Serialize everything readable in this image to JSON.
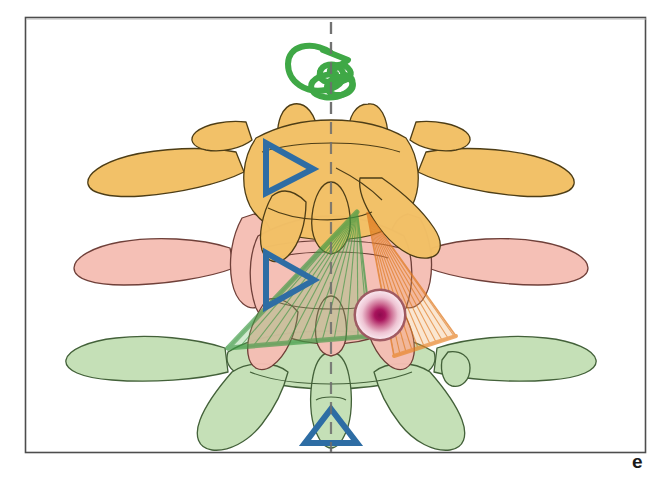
{
  "figure": {
    "panel_letter": "e",
    "caption_visible": "",
    "frame": {
      "x": 25,
      "y": 17,
      "width": 620,
      "height": 435,
      "border_color": "#4d4d4d"
    },
    "background_color": "#ffffff"
  },
  "colors": {
    "vertebra_superior_fill": "#F2C066",
    "vertebra_superior_stroke": "#4a3a12",
    "vertebra_middle_fill": "#F5BEB4",
    "vertebra_middle_stroke": "#6b3a33",
    "vertebra_inferior_fill": "#C4DFB5",
    "vertebra_inferior_stroke": "#3d5c33",
    "rotation_arrow": "#3FA846",
    "marker_triangle": "#2E6DA4",
    "force_cone_green": "#4CA64C",
    "force_cone_orange": "#E8862A",
    "target_center": "#A8135C",
    "target_edge": "#F7DDE6",
    "target_ring": "#9C5560",
    "midline_axis": "#808080"
  },
  "anatomy": {
    "vertebrae": [
      {
        "name": "superior-vertebra",
        "level_color": "orange",
        "position": "top"
      },
      {
        "name": "middle-vertebra",
        "level_color": "pink",
        "position": "middle"
      },
      {
        "name": "inferior-vertebra",
        "level_color": "green",
        "position": "bottom"
      }
    ],
    "midline_axis": {
      "name": "vertical-dashed-axis",
      "style": "dashed",
      "x": 331,
      "y_top": 22,
      "y_bottom": 452
    }
  },
  "overlays": {
    "rotation_arrow": {
      "name": "axial-rotation-arrow",
      "color": "#3FA846",
      "description": "curved looping arrow around vertical axis above superior vertebra",
      "center_x": 331,
      "center_y": 68
    },
    "marker_triangles": [
      {
        "name": "marker-triangle-superior",
        "direction": "right",
        "x": 262,
        "y": 140,
        "size": 48
      },
      {
        "name": "marker-triangle-middle",
        "direction": "right",
        "x": 262,
        "y": 252,
        "size": 48
      },
      {
        "name": "marker-triangle-inferior",
        "direction": "up",
        "x": 295,
        "y": 404,
        "size": 56
      }
    ],
    "force_cones": [
      {
        "name": "force-cone-green",
        "color": "#4CA64C",
        "apex_x": 357,
        "apex_y": 212,
        "spread_from_x": 228,
        "spread_from_y": 344,
        "spread_to_x": 368,
        "spread_to_y": 338,
        "ray_count": 14
      },
      {
        "name": "force-cone-orange",
        "color": "#E8862A",
        "apex_x": 367,
        "apex_y": 212,
        "spread_from_x": 398,
        "spread_from_y": 352,
        "spread_to_x": 452,
        "spread_to_y": 338,
        "ray_count": 14
      }
    ],
    "target_circle": {
      "name": "target-lesion-circle",
      "center_x": 380,
      "center_y": 315,
      "radius": 25,
      "center_color": "#A8135C",
      "edge_color": "#F7DDE6",
      "ring_color": "#9C5560"
    }
  }
}
